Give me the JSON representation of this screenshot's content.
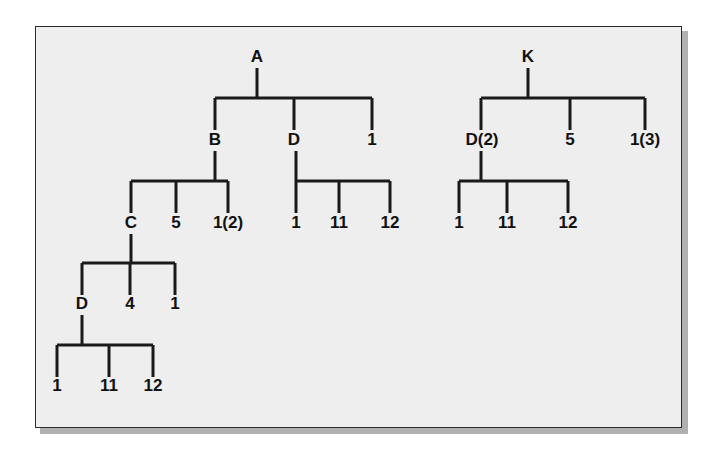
{
  "panel": {
    "background_color": "#eeeeee",
    "border_color": "#2a2a2a",
    "shadow_color": "#b0b0b0"
  },
  "style": {
    "line_color": "#1a1a1a",
    "text_color": "#111111",
    "line_width": 3
  },
  "diagram": {
    "type": "tree-diagram",
    "tree_count": 2,
    "trees": [
      {
        "root": "A",
        "id": "tree-a"
      },
      {
        "root": "K",
        "id": "tree-k"
      }
    ]
  },
  "labels": {
    "a_root": "A",
    "a_child_1": "B",
    "a_child_2": "D",
    "a_child_3": "1",
    "b_child_1": "C",
    "b_child_2": "5",
    "b_child_3": "1(2)",
    "c_child_1": "D",
    "c_child_2": "4",
    "c_child_3": "1",
    "cd_child_1": "1",
    "cd_child_2": "11",
    "cd_child_3": "12",
    "ad_child_1": "1",
    "ad_child_2": "11",
    "ad_child_3": "12",
    "k_root": "K",
    "k_child_1": "D(2)",
    "k_child_2": "5",
    "k_child_3": "1(3)",
    "kd_child_1": "1",
    "kd_child_2": "11",
    "kd_child_3": "12"
  },
  "nodes": [
    {
      "name": "a-root",
      "label": "A",
      "x": 257,
      "y": 62,
      "tree": "A",
      "depth": 0
    },
    {
      "name": "a-child-b",
      "label": "B",
      "x": 215,
      "y": 145,
      "tree": "A",
      "depth": 1
    },
    {
      "name": "a-child-d",
      "label": "D",
      "x": 294,
      "y": 145,
      "tree": "A",
      "depth": 1
    },
    {
      "name": "a-child-1",
      "label": "1",
      "x": 372,
      "y": 145,
      "tree": "A",
      "depth": 1
    },
    {
      "name": "b-child-c",
      "label": "C",
      "x": 131,
      "y": 228,
      "tree": "A",
      "depth": 2
    },
    {
      "name": "b-child-5",
      "label": "5",
      "x": 176,
      "y": 228,
      "tree": "A",
      "depth": 2
    },
    {
      "name": "b-child-1-2",
      "label": "1(2)",
      "x": 228,
      "y": 228,
      "tree": "A",
      "depth": 2
    },
    {
      "name": "ad-child-1",
      "label": "1",
      "x": 296,
      "y": 228,
      "tree": "A",
      "depth": 2
    },
    {
      "name": "ad-child-11",
      "label": "11",
      "x": 339,
      "y": 228,
      "tree": "A",
      "depth": 2
    },
    {
      "name": "ad-child-12",
      "label": "12",
      "x": 390,
      "y": 228,
      "tree": "A",
      "depth": 2
    },
    {
      "name": "c-child-d",
      "label": "D",
      "x": 82,
      "y": 309,
      "tree": "A",
      "depth": 3
    },
    {
      "name": "c-child-4",
      "label": "4",
      "x": 130,
      "y": 309,
      "tree": "A",
      "depth": 3
    },
    {
      "name": "c-child-1",
      "label": "1",
      "x": 175,
      "y": 309,
      "tree": "A",
      "depth": 3
    },
    {
      "name": "cd-child-1",
      "label": "1",
      "x": 57,
      "y": 391,
      "tree": "A",
      "depth": 4
    },
    {
      "name": "cd-child-11",
      "label": "11",
      "x": 109,
      "y": 391,
      "tree": "A",
      "depth": 4
    },
    {
      "name": "cd-child-12",
      "label": "12",
      "x": 153,
      "y": 391,
      "tree": "A",
      "depth": 4
    },
    {
      "name": "k-root",
      "label": "K",
      "x": 528,
      "y": 62,
      "tree": "K",
      "depth": 0
    },
    {
      "name": "k-child-d2",
      "label": "D(2)",
      "x": 482,
      "y": 145,
      "tree": "K",
      "depth": 1
    },
    {
      "name": "k-child-5",
      "label": "5",
      "x": 570,
      "y": 145,
      "tree": "K",
      "depth": 1
    },
    {
      "name": "k-child-1-3",
      "label": "1(3)",
      "x": 645,
      "y": 145,
      "tree": "K",
      "depth": 1
    },
    {
      "name": "kd-child-1",
      "label": "1",
      "x": 459,
      "y": 228,
      "tree": "K",
      "depth": 2
    },
    {
      "name": "kd-child-11",
      "label": "11",
      "x": 507,
      "y": 228,
      "tree": "K",
      "depth": 2
    },
    {
      "name": "kd-child-12",
      "label": "12",
      "x": 568,
      "y": 228,
      "tree": "K",
      "depth": 2
    }
  ],
  "edges": [
    {
      "name": "edge-a-bar",
      "parent": "A",
      "stem_x": 257,
      "stem_top": 68,
      "bar_y": 98,
      "bar_left": 215,
      "bar_right": 372,
      "children_x": [
        215,
        294,
        372
      ],
      "child_bottom": 130
    },
    {
      "name": "edge-b-bar",
      "parent": "B",
      "stem_x": 215,
      "stem_top": 151,
      "bar_y": 181,
      "bar_left": 131,
      "bar_right": 228,
      "children_x": [
        131,
        176,
        228
      ],
      "child_bottom": 213
    },
    {
      "name": "edge-ad-bar",
      "parent": "D",
      "stem_x": 296,
      "stem_top": 151,
      "bar_y": 181,
      "bar_left": 296,
      "bar_right": 390,
      "children_x": [
        296,
        339,
        390
      ],
      "child_bottom": 213
    },
    {
      "name": "edge-c-bar",
      "parent": "C",
      "stem_x": 131,
      "stem_top": 234,
      "bar_y": 263,
      "bar_left": 82,
      "bar_right": 175,
      "children_x": [
        82,
        130,
        175
      ],
      "child_bottom": 295
    },
    {
      "name": "edge-cd-bar",
      "parent": "D",
      "stem_x": 82,
      "stem_top": 315,
      "bar_y": 345,
      "bar_left": 57,
      "bar_right": 153,
      "children_x": [
        57,
        109,
        153
      ],
      "child_bottom": 377
    },
    {
      "name": "edge-k-bar",
      "parent": "K",
      "stem_x": 528,
      "stem_top": 68,
      "bar_y": 98,
      "bar_left": 481,
      "bar_right": 645,
      "children_x": [
        481,
        570,
        645
      ],
      "child_bottom": 130
    },
    {
      "name": "edge-kd-bar",
      "parent": "D(2)",
      "stem_x": 481,
      "stem_top": 151,
      "bar_y": 181,
      "bar_left": 459,
      "bar_right": 568,
      "children_x": [
        459,
        507,
        568
      ],
      "child_bottom": 213
    }
  ]
}
